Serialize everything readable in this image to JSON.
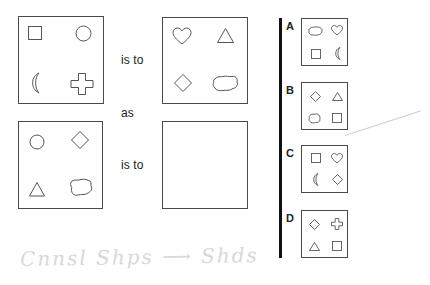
{
  "puzzle": {
    "connectors": {
      "is_to_1": "is to",
      "as": "as",
      "is_to_2": "is to"
    },
    "stimulus_boxes": [
      {
        "id": "box1",
        "shapes": [
          "square",
          "circle",
          "crescent",
          "cross"
        ]
      },
      {
        "id": "box2",
        "shapes": [
          "heart",
          "triangle",
          "diamond",
          "cloud"
        ]
      },
      {
        "id": "box3",
        "shapes": [
          "circle",
          "diamond",
          "triangle",
          "cloud"
        ]
      },
      {
        "id": "box4",
        "shapes": []
      }
    ],
    "options": [
      {
        "label": "A",
        "shapes": [
          "cloud",
          "heart",
          "square",
          "crescent"
        ]
      },
      {
        "label": "B",
        "shapes": [
          "diamond",
          "triangle",
          "cloud",
          "square"
        ]
      },
      {
        "label": "C",
        "shapes": [
          "square",
          "heart",
          "crescent",
          "diamond"
        ]
      },
      {
        "label": "D",
        "shapes": [
          "diamond",
          "cross",
          "triangle",
          "square"
        ]
      }
    ]
  },
  "colors": {
    "stroke": "#4a4a4a",
    "divider": "#111111",
    "background": "#ffffff"
  }
}
